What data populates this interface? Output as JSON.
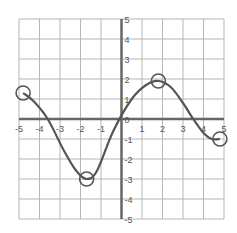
{
  "chart_data": {
    "type": "line",
    "title": "",
    "xlabel": "",
    "ylabel": "",
    "xlim": [
      -5,
      5
    ],
    "ylim": [
      -5,
      5
    ],
    "grid": true,
    "x_ticks": [
      "-5",
      "-4",
      "-3",
      "-2",
      "-1",
      "0",
      "1",
      "2",
      "3",
      "4",
      "5"
    ],
    "y_ticks": [
      "5",
      "4",
      "3",
      "2",
      "1",
      "0",
      "-1",
      "-2",
      "-3",
      "-4",
      "-5"
    ],
    "series": [
      {
        "name": "curve",
        "x": [
          -4.8,
          -4.3,
          -3.6,
          -2.8,
          -2.2,
          -1.7,
          -1.2,
          -0.4,
          0.5,
          1.2,
          1.8,
          2.4,
          3.0,
          3.5,
          4.0,
          4.4,
          4.8
        ],
        "y": [
          1.3,
          0.9,
          0.0,
          -1.6,
          -2.6,
          -3.0,
          -2.6,
          -0.6,
          1.0,
          1.7,
          1.9,
          1.6,
          0.8,
          0.0,
          -0.7,
          -1.0,
          -1.0
        ]
      }
    ],
    "annotations": [
      {
        "type": "circle",
        "x": -4.8,
        "y": 1.3
      },
      {
        "type": "circle",
        "x": -1.7,
        "y": -3.0
      },
      {
        "type": "circle",
        "x": 1.8,
        "y": 1.9
      },
      {
        "type": "circle",
        "x": 4.8,
        "y": -1.0
      }
    ]
  },
  "colors": {
    "grid": "#b5b5b5",
    "axis": "#666666",
    "curve": "#555555"
  }
}
